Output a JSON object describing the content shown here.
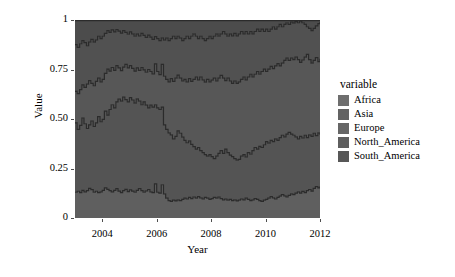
{
  "chart_data": {
    "type": "area",
    "title": "",
    "subtitle": "",
    "xlabel": "Year",
    "ylabel": "Value",
    "xlim": [
      2003.0,
      2012.0
    ],
    "ylim": [
      0,
      1
    ],
    "grid": false,
    "stacked": true,
    "stack_mode": "fill",
    "legend_title": "variable",
    "legend_position": "right",
    "xticks": [
      2004,
      2006,
      2008,
      2010,
      2012
    ],
    "xticklabels": [
      "2004",
      "2006",
      "2008",
      "2010",
      "2012"
    ],
    "yticks": [
      0,
      0.25,
      0.5,
      0.75,
      1
    ],
    "yticklabels": [
      "0",
      "0.25",
      "0.50",
      "0.75",
      "1"
    ],
    "panel_background": "#e9e9e9",
    "line_color": "#2b2b2b",
    "x": [
      2003.0,
      2003.08,
      2003.17,
      2003.25,
      2003.33,
      2003.42,
      2003.5,
      2003.58,
      2003.67,
      2003.75,
      2003.83,
      2003.92,
      2004.0,
      2004.08,
      2004.17,
      2004.25,
      2004.33,
      2004.42,
      2004.5,
      2004.58,
      2004.67,
      2004.75,
      2004.83,
      2004.92,
      2005.0,
      2005.08,
      2005.17,
      2005.25,
      2005.33,
      2005.42,
      2005.5,
      2005.58,
      2005.67,
      2005.75,
      2005.83,
      2005.92,
      2006.0,
      2006.08,
      2006.17,
      2006.25,
      2006.33,
      2006.42,
      2006.5,
      2006.58,
      2006.67,
      2006.75,
      2006.83,
      2006.92,
      2007.0,
      2007.08,
      2007.17,
      2007.25,
      2007.33,
      2007.42,
      2007.5,
      2007.58,
      2007.67,
      2007.75,
      2007.83,
      2007.92,
      2008.0,
      2008.08,
      2008.17,
      2008.25,
      2008.33,
      2008.42,
      2008.5,
      2008.58,
      2008.67,
      2008.75,
      2008.83,
      2008.92,
      2009.0,
      2009.08,
      2009.17,
      2009.25,
      2009.33,
      2009.42,
      2009.5,
      2009.58,
      2009.67,
      2009.75,
      2009.83,
      2009.92,
      2010.0,
      2010.08,
      2010.17,
      2010.25,
      2010.33,
      2010.42,
      2010.5,
      2010.58,
      2010.67,
      2010.75,
      2010.83,
      2010.92,
      2011.0,
      2011.08,
      2011.17,
      2011.25,
      2011.33,
      2011.42,
      2011.5,
      2011.58,
      2011.67,
      2011.75,
      2011.83,
      2011.92,
      2012.0
    ],
    "boundaries": {
      "b1": [
        0.13,
        0.135,
        0.128,
        0.14,
        0.132,
        0.138,
        0.15,
        0.143,
        0.13,
        0.135,
        0.128,
        0.132,
        0.14,
        0.152,
        0.145,
        0.138,
        0.132,
        0.14,
        0.148,
        0.136,
        0.128,
        0.138,
        0.145,
        0.133,
        0.142,
        0.136,
        0.13,
        0.14,
        0.148,
        0.138,
        0.13,
        0.137,
        0.144,
        0.132,
        0.128,
        0.172,
        0.13,
        0.126,
        0.168,
        0.122,
        0.1,
        0.088,
        0.084,
        0.09,
        0.086,
        0.092,
        0.088,
        0.094,
        0.1,
        0.096,
        0.104,
        0.098,
        0.106,
        0.1,
        0.108,
        0.102,
        0.096,
        0.104,
        0.1,
        0.094,
        0.098,
        0.104,
        0.1,
        0.106,
        0.098,
        0.092,
        0.096,
        0.09,
        0.094,
        0.088,
        0.092,
        0.086,
        0.09,
        0.096,
        0.092,
        0.1,
        0.094,
        0.088,
        0.092,
        0.098,
        0.094,
        0.088,
        0.084,
        0.09,
        0.094,
        0.1,
        0.108,
        0.102,
        0.096,
        0.104,
        0.11,
        0.118,
        0.112,
        0.106,
        0.114,
        0.122,
        0.118,
        0.126,
        0.132,
        0.126,
        0.134,
        0.128,
        0.138,
        0.144,
        0.136,
        0.15,
        0.158,
        0.152,
        0.16
      ],
      "b2": [
        0.48,
        0.448,
        0.468,
        0.505,
        0.476,
        0.452,
        0.47,
        0.49,
        0.462,
        0.48,
        0.512,
        0.486,
        0.498,
        0.54,
        0.52,
        0.548,
        0.572,
        0.556,
        0.586,
        0.6,
        0.59,
        0.61,
        0.598,
        0.586,
        0.608,
        0.596,
        0.58,
        0.602,
        0.59,
        0.572,
        0.586,
        0.57,
        0.556,
        0.57,
        0.56,
        0.572,
        0.556,
        0.548,
        0.56,
        0.47,
        0.448,
        0.43,
        0.42,
        0.4,
        0.412,
        0.44,
        0.428,
        0.408,
        0.392,
        0.38,
        0.39,
        0.372,
        0.36,
        0.348,
        0.356,
        0.34,
        0.33,
        0.32,
        0.312,
        0.32,
        0.31,
        0.3,
        0.312,
        0.326,
        0.34,
        0.326,
        0.348,
        0.33,
        0.318,
        0.31,
        0.3,
        0.292,
        0.296,
        0.312,
        0.32,
        0.308,
        0.33,
        0.322,
        0.34,
        0.356,
        0.348,
        0.362,
        0.356,
        0.37,
        0.386,
        0.378,
        0.392,
        0.386,
        0.4,
        0.392,
        0.406,
        0.418,
        0.41,
        0.424,
        0.432,
        0.424,
        0.418,
        0.41,
        0.4,
        0.412,
        0.404,
        0.418,
        0.406,
        0.42,
        0.412,
        0.428,
        0.416,
        0.43,
        0.42
      ],
      "b3": [
        0.64,
        0.628,
        0.648,
        0.672,
        0.66,
        0.676,
        0.694,
        0.68,
        0.668,
        0.69,
        0.706,
        0.688,
        0.7,
        0.73,
        0.752,
        0.742,
        0.76,
        0.746,
        0.77,
        0.758,
        0.744,
        0.762,
        0.776,
        0.758,
        0.77,
        0.756,
        0.742,
        0.758,
        0.746,
        0.76,
        0.748,
        0.736,
        0.75,
        0.74,
        0.728,
        0.778,
        0.74,
        0.724,
        0.776,
        0.716,
        0.7,
        0.688,
        0.704,
        0.69,
        0.706,
        0.722,
        0.706,
        0.692,
        0.7,
        0.688,
        0.704,
        0.69,
        0.7,
        0.712,
        0.698,
        0.712,
        0.698,
        0.686,
        0.7,
        0.688,
        0.696,
        0.706,
        0.692,
        0.706,
        0.72,
        0.706,
        0.694,
        0.706,
        0.692,
        0.68,
        0.692,
        0.68,
        0.688,
        0.7,
        0.712,
        0.698,
        0.712,
        0.726,
        0.712,
        0.726,
        0.74,
        0.726,
        0.74,
        0.752,
        0.74,
        0.752,
        0.766,
        0.754,
        0.768,
        0.78,
        0.768,
        0.782,
        0.796,
        0.808,
        0.796,
        0.808,
        0.8,
        0.812,
        0.8,
        0.786,
        0.798,
        0.812,
        0.826,
        0.8,
        0.782,
        0.796,
        0.81,
        0.79,
        0.804
      ],
      "b4": [
        0.876,
        0.862,
        0.88,
        0.896,
        0.886,
        0.87,
        0.888,
        0.902,
        0.888,
        0.9,
        0.918,
        0.906,
        0.918,
        0.932,
        0.946,
        0.938,
        0.95,
        0.94,
        0.952,
        0.944,
        0.934,
        0.946,
        0.938,
        0.928,
        0.94,
        0.93,
        0.918,
        0.93,
        0.92,
        0.932,
        0.922,
        0.912,
        0.924,
        0.914,
        0.902,
        0.916,
        0.906,
        0.896,
        0.91,
        0.898,
        0.908,
        0.896,
        0.906,
        0.918,
        0.906,
        0.918,
        0.908,
        0.896,
        0.906,
        0.918,
        0.906,
        0.918,
        0.93,
        0.918,
        0.906,
        0.918,
        0.906,
        0.896,
        0.906,
        0.918,
        0.906,
        0.918,
        0.93,
        0.918,
        0.93,
        0.942,
        0.93,
        0.918,
        0.93,
        0.92,
        0.932,
        0.92,
        0.93,
        0.942,
        0.93,
        0.942,
        0.93,
        0.942,
        0.93,
        0.942,
        0.954,
        0.942,
        0.954,
        0.942,
        0.954,
        0.942,
        0.954,
        0.966,
        0.954,
        0.966,
        0.978,
        0.966,
        0.978,
        0.986,
        0.978,
        0.99,
        0.984,
        0.992,
        0.986,
        0.994,
        0.986,
        0.978,
        0.966,
        0.958,
        0.946,
        0.958,
        0.97,
        0.982,
        0.99
      ]
    },
    "series": [
      {
        "name": "Africa",
        "color": "#5f5f5f",
        "legend_color": "#6e6e6e"
      },
      {
        "name": "Asia",
        "color": "#545454",
        "legend_color": "#636363"
      },
      {
        "name": "Europe",
        "color": "#575757",
        "legend_color": "#666666"
      },
      {
        "name": "North_America",
        "color": "#515151",
        "legend_color": "#5e5e5e"
      },
      {
        "name": "South_America",
        "color": "#4c4c4c",
        "legend_color": "#575757"
      }
    ]
  },
  "legend": {
    "title": "variable",
    "items": [
      {
        "label": "Africa"
      },
      {
        "label": "Asia"
      },
      {
        "label": "Europe"
      },
      {
        "label": "North_America"
      },
      {
        "label": "South_America"
      }
    ]
  },
  "axes": {
    "x_title": "Year",
    "y_title": "Value"
  }
}
